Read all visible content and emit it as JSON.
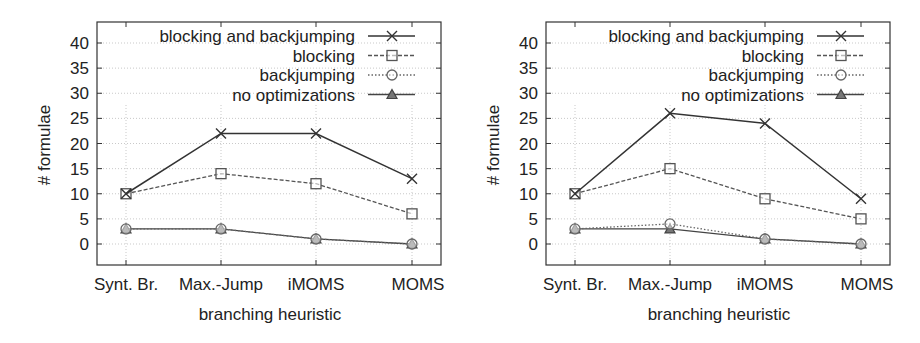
{
  "chart_data": [
    {
      "type": "line",
      "title": "",
      "xlabel": "branching heuristic",
      "ylabel": "# formulae",
      "categories": [
        "Synt. Br.",
        "Max.-Jump",
        "iMOMS",
        "MOMS"
      ],
      "yticks": [
        0,
        5,
        10,
        15,
        20,
        25,
        30,
        35,
        40
      ],
      "ylim": [
        -4,
        44
      ],
      "grid": true,
      "legend_position": "top-right",
      "series": [
        {
          "name": "blocking and backjumping",
          "marker": "x",
          "line": "solid",
          "values": [
            10,
            22,
            22,
            13
          ]
        },
        {
          "name": "blocking",
          "marker": "square",
          "line": "dashed",
          "values": [
            10,
            14,
            12,
            6
          ]
        },
        {
          "name": "backjumping",
          "marker": "circle",
          "line": "dotted",
          "values": [
            3,
            3,
            1,
            0
          ]
        },
        {
          "name": "no optimizations",
          "marker": "triangle",
          "line": "solid",
          "values": [
            3,
            3,
            1,
            0
          ]
        }
      ]
    },
    {
      "type": "line",
      "title": "",
      "xlabel": "branching heuristic",
      "ylabel": "# formulae",
      "categories": [
        "Synt. Br.",
        "Max.-Jump",
        "iMOMS",
        "MOMS"
      ],
      "yticks": [
        0,
        5,
        10,
        15,
        20,
        25,
        30,
        35,
        40
      ],
      "ylim": [
        -4,
        44
      ],
      "grid": true,
      "legend_position": "top-right",
      "series": [
        {
          "name": "blocking and backjumping",
          "marker": "x",
          "line": "solid",
          "values": [
            10,
            26,
            24,
            9
          ]
        },
        {
          "name": "blocking",
          "marker": "square",
          "line": "dashed",
          "values": [
            10,
            15,
            9,
            5
          ]
        },
        {
          "name": "backjumping",
          "marker": "circle",
          "line": "dotted",
          "values": [
            3,
            4,
            1,
            0
          ]
        },
        {
          "name": "no optimizations",
          "marker": "triangle",
          "line": "solid",
          "values": [
            3,
            3,
            1,
            0
          ]
        }
      ]
    }
  ]
}
